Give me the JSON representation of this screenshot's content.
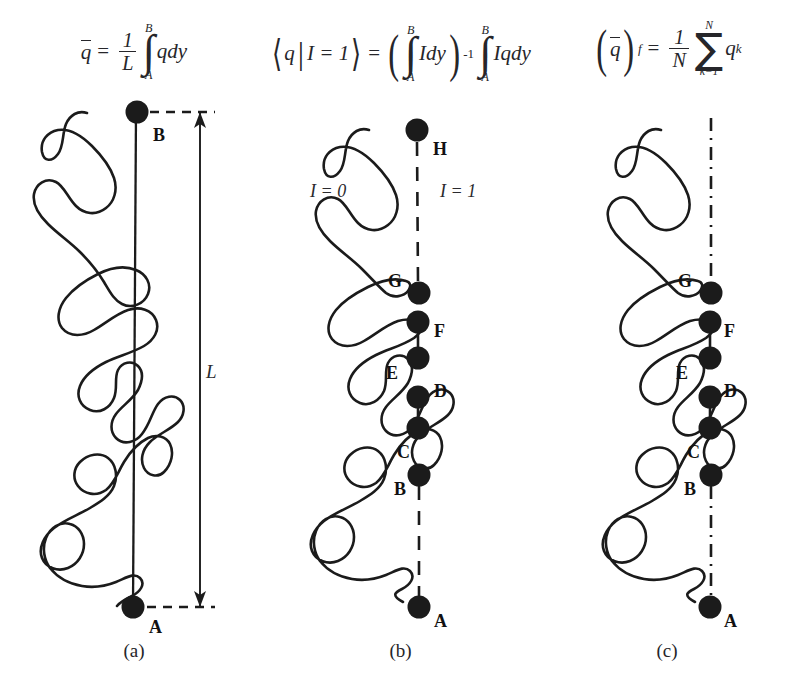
{
  "figure": {
    "type": "scientific-diagram",
    "background_color": "#ffffff",
    "ink_color": "#1b1b1b"
  },
  "panels": [
    {
      "id": "a",
      "caption": "(a)",
      "formula_parts": {
        "lhs_var": "q",
        "frac_num": "1",
        "frac_den": "L",
        "int_upper": "B",
        "int_lower": "A",
        "integrand": "qdy"
      },
      "line_style": "solid",
      "dots": [
        {
          "label": "B",
          "x": 137,
          "y": 112
        },
        {
          "label": "A",
          "x": 133,
          "y": 607
        }
      ],
      "dimension": {
        "label": "L",
        "label_x": 206,
        "label_y": 362,
        "arrow_x": 200,
        "top_y": 112,
        "bottom_y": 607
      }
    },
    {
      "id": "b",
      "caption": "(b)",
      "formula_parts": {
        "lhs": "q",
        "condition": "I = 1",
        "int_upper": "B",
        "int_lower": "A",
        "integrand_1": "Idy",
        "exponent": "-1",
        "integrand_2": "Iqdy"
      },
      "line_style": "dashed",
      "region_labels": [
        {
          "text": "I = 0",
          "x": 310,
          "y": 190
        },
        {
          "text": "I = 1",
          "x": 440,
          "y": 190
        }
      ],
      "dots": [
        {
          "label": "H",
          "x": 417,
          "y": 130,
          "label_x": 433,
          "label_y": 147
        },
        {
          "label": "G",
          "x": 419,
          "y": 293,
          "label_x": 390,
          "label_y": 278
        },
        {
          "label": "F",
          "x": 418,
          "y": 322,
          "label_x": 434,
          "label_y": 330
        },
        {
          "label": "E",
          "x": 418,
          "y": 358,
          "label_x": 388,
          "label_y": 372
        },
        {
          "label": "D",
          "x": 418,
          "y": 397,
          "label_x": 434,
          "label_y": 389
        },
        {
          "label": "",
          "x": 418,
          "y": 428,
          "label_x": 0,
          "label_y": 0
        },
        {
          "label": "C",
          "x": 419,
          "y": 475,
          "label_x": 399,
          "label_y": 450
        },
        {
          "label": "B",
          "x": 0,
          "y": 0,
          "label_x": 396,
          "label_y": 487
        },
        {
          "label": "A",
          "x": 419,
          "y": 607,
          "label_x": 434,
          "label_y": 618
        }
      ]
    },
    {
      "id": "c",
      "caption": "(c)",
      "formula_parts": {
        "lhs_var": "q",
        "subscript": "f",
        "frac_num": "1",
        "frac_den": "N",
        "sum_upper": "N",
        "sum_lower": "k=1",
        "term": "q",
        "term_sub": "k"
      },
      "line_style": "dash-dot",
      "dots": [
        {
          "label": "G",
          "x": 711,
          "y": 293,
          "label_x": 682,
          "label_y": 278
        },
        {
          "label": "F",
          "x": 710,
          "y": 322,
          "label_x": 726,
          "label_y": 330
        },
        {
          "label": "E",
          "x": 710,
          "y": 358,
          "label_x": 680,
          "label_y": 372
        },
        {
          "label": "D",
          "x": 710,
          "y": 397,
          "label_x": 726,
          "label_y": 389
        },
        {
          "label": "",
          "x": 710,
          "y": 428,
          "label_x": 0,
          "label_y": 0
        },
        {
          "label": "C",
          "x": 711,
          "y": 475,
          "label_x": 691,
          "label_y": 450
        },
        {
          "label": "B",
          "x": 0,
          "y": 0,
          "label_x": 688,
          "label_y": 487
        },
        {
          "label": "A",
          "x": 710,
          "y": 607,
          "label_x": 726,
          "label_y": 618
        }
      ]
    }
  ]
}
